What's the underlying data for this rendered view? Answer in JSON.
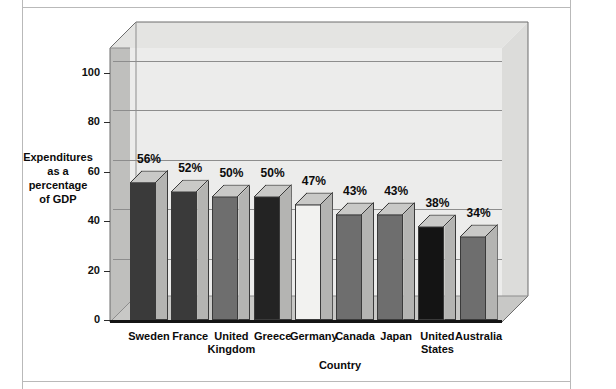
{
  "chart_data": {
    "type": "bar",
    "title": "",
    "xlabel": "Country",
    "ylabel": "Expenditures\nas a\npercentage\nof GDP",
    "categories": [
      "Sweden",
      "France",
      "United\nKingdom",
      "Greece",
      "Germany",
      "Canada",
      "Japan",
      "United\nStates",
      "Australia"
    ],
    "values": [
      56,
      52,
      50,
      50,
      47,
      43,
      43,
      38,
      34
    ],
    "data_labels": [
      "56%",
      "52%",
      "50%",
      "50%",
      "47%",
      "43%",
      "43%",
      "38%",
      "34%"
    ],
    "ylim": [
      0,
      110
    ],
    "yticks": [
      0,
      20,
      40,
      60,
      80,
      100
    ],
    "ytick_labels": [
      "0",
      "20",
      "40",
      "60",
      "80",
      "100"
    ],
    "grid": true,
    "legend": "none",
    "style": "3d-column",
    "bar_face_colors": [
      "#3a3a3a",
      "#3a3a3a",
      "#6e6e6e",
      "#232323",
      "#f2f2f0",
      "#6e6e6e",
      "#6e6e6e",
      "#141414",
      "#6e6e6e"
    ],
    "bar_top_color": "#c9c9c7",
    "bar_side_color": "#b4b4b2",
    "plot_background": "#ececeb",
    "wall_color": "#bfbfbd",
    "floor_color": "#c8c8c6",
    "gridline_color": "#8d8d8d",
    "axis_color": "#141414"
  }
}
